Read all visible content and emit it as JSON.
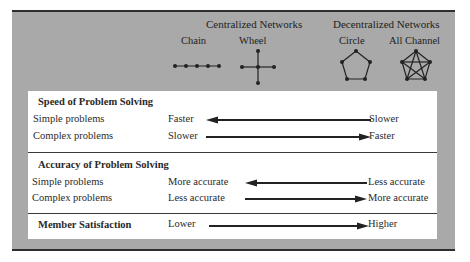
{
  "header": {
    "centralized_title": "Centralized Networks",
    "decentralized_title": "Decentralized Networks",
    "networks": [
      {
        "name": "Chain",
        "type": "centralized",
        "shape": "chain-icon"
      },
      {
        "name": "Wheel",
        "type": "centralized",
        "shape": "wheel-icon"
      },
      {
        "name": "Circle",
        "type": "decentralized",
        "shape": "circle-network-icon"
      },
      {
        "name": "All Channel",
        "type": "decentralized",
        "shape": "all-channel-icon"
      }
    ]
  },
  "sections": [
    {
      "title": "Speed of Problem Solving",
      "rows": [
        {
          "label": "Simple problems",
          "left": "Faster",
          "right": "Slower",
          "arrow": "left"
        },
        {
          "label": "Complex problems",
          "left": "Slower",
          "right": "Faster",
          "arrow": "right"
        }
      ]
    },
    {
      "title": "Accuracy of Problem Solving",
      "rows": [
        {
          "label": "Simple problems",
          "left": "More accurate",
          "right": "Less accurate",
          "arrow": "left"
        },
        {
          "label": "Complex problems",
          "left": "Less accurate",
          "right": "More accurate",
          "arrow": "right"
        }
      ]
    },
    {
      "title": "Member Satisfaction",
      "rows": [
        {
          "label": "",
          "left": "Lower",
          "right": "Higher",
          "arrow": "right"
        }
      ]
    }
  ],
  "colors": {
    "panel_gray": "#a9a9a9",
    "box_white": "#ffffff",
    "ink": "#2a2a2a"
  }
}
